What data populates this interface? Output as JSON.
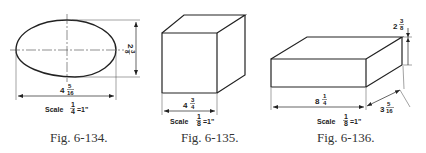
{
  "figures": [
    {
      "id": "fig-6-134",
      "caption": "Fig. 6-134.",
      "shape": "ellipse",
      "width_dim": {
        "whole": "4",
        "num": "5",
        "den": "16"
      },
      "height_dim": {
        "whole": "2",
        "num": "3",
        "den": "8"
      },
      "scale": {
        "prefix": "Scale",
        "num": "1",
        "den": "4",
        "suffix": "=1\""
      }
    },
    {
      "id": "fig-6-135",
      "caption": "Fig. 6-135.",
      "shape": "cube",
      "width_dim": {
        "whole": "4",
        "num": "3",
        "den": "4"
      },
      "scale": {
        "prefix": "Scale",
        "num": "1",
        "den": "8",
        "suffix": "=1\""
      }
    },
    {
      "id": "fig-6-136",
      "caption": "Fig. 6-136.",
      "shape": "rectangular-prism",
      "length_dim": {
        "whole": "8",
        "num": "1",
        "den": "4"
      },
      "height_dim": {
        "whole": "2",
        "num": "3",
        "den": "8"
      },
      "depth_dim": {
        "whole": "3",
        "num": "5",
        "den": "16"
      },
      "scale": {
        "prefix": "Scale",
        "num": "1",
        "den": "8",
        "suffix": "=1\""
      }
    }
  ]
}
